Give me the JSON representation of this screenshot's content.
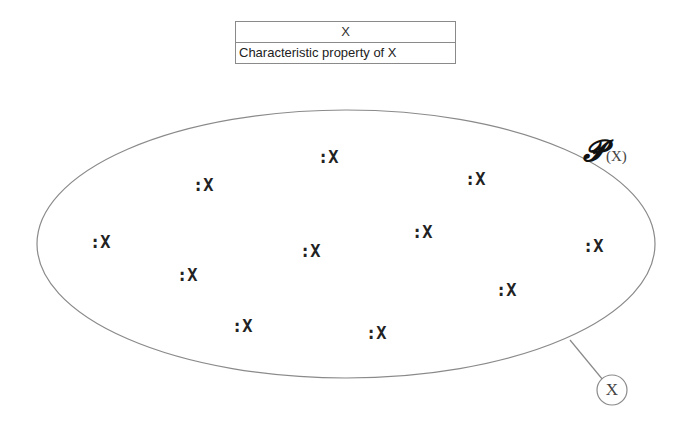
{
  "class_box": {
    "name": "X",
    "attribute": "Characteristic property of X"
  },
  "powerset_label": {
    "symbol": "𝓟",
    "argument": "(X)"
  },
  "members": [
    {
      "label": ":X",
      "x": 318,
      "y": 147
    },
    {
      "label": ":X",
      "x": 193,
      "y": 175
    },
    {
      "label": ":X",
      "x": 465,
      "y": 169
    },
    {
      "label": ":X",
      "x": 90,
      "y": 232
    },
    {
      "label": ":X",
      "x": 412,
      "y": 222
    },
    {
      "label": ":X",
      "x": 300,
      "y": 241
    },
    {
      "label": ":X",
      "x": 583,
      "y": 236
    },
    {
      "label": ":X",
      "x": 177,
      "y": 265
    },
    {
      "label": ":X",
      "x": 496,
      "y": 280
    },
    {
      "label": ":X",
      "x": 232,
      "y": 316
    },
    {
      "label": ":X",
      "x": 366,
      "y": 323
    }
  ],
  "class_ref_circle": {
    "label": "X"
  },
  "colors": {
    "stroke": "#8a8a8a",
    "text": "#222222",
    "background": "#ffffff"
  }
}
